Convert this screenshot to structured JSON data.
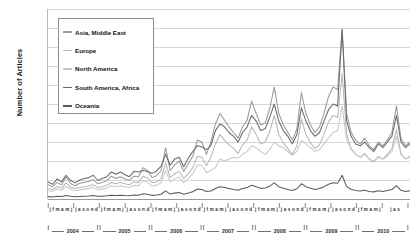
{
  "chart_data": {
    "type": "line",
    "title": "",
    "xlabel": "",
    "ylabel": "Number of Articles",
    "ylim": [
      0,
      2000
    ],
    "yticks": [
      0,
      200,
      400,
      600,
      800,
      1000,
      1200,
      1400,
      1600,
      1800,
      2000
    ],
    "grid": true,
    "legend_position": "upper-left-inside",
    "years": [
      "2004",
      "2005",
      "2006",
      "2007",
      "2008",
      "2009",
      "2010"
    ],
    "months_pattern": [
      "j",
      "f",
      "m",
      "a",
      "m",
      "j",
      "j",
      "a",
      "s",
      "o",
      "n",
      "d"
    ],
    "month_axis_groups": [
      "j f m a m j",
      "j a s o n d",
      "j f m a m j",
      "j a s o n d",
      "j f m a m j",
      "j a s o n d",
      "j f m a m j",
      "j a s o n d",
      "j f m a m j",
      "j a s o n d",
      "j f m a m j",
      "j a s o n d",
      "j f m a m j",
      "j a s"
    ],
    "x": [
      "2004-01",
      "2004-02",
      "2004-03",
      "2004-04",
      "2004-05",
      "2004-06",
      "2004-07",
      "2004-08",
      "2004-09",
      "2004-10",
      "2004-11",
      "2004-12",
      "2005-01",
      "2005-02",
      "2005-03",
      "2005-04",
      "2005-05",
      "2005-06",
      "2005-07",
      "2005-08",
      "2005-09",
      "2005-10",
      "2005-11",
      "2005-12",
      "2006-01",
      "2006-02",
      "2006-03",
      "2006-04",
      "2006-05",
      "2006-06",
      "2006-07",
      "2006-08",
      "2006-09",
      "2006-10",
      "2006-11",
      "2006-12",
      "2007-01",
      "2007-02",
      "2007-03",
      "2007-04",
      "2007-05",
      "2007-06",
      "2007-07",
      "2007-08",
      "2007-09",
      "2007-10",
      "2007-11",
      "2007-12",
      "2008-01",
      "2008-02",
      "2008-03",
      "2008-04",
      "2008-05",
      "2008-06",
      "2008-07",
      "2008-08",
      "2008-09",
      "2008-10",
      "2008-11",
      "2008-12",
      "2009-01",
      "2009-02",
      "2009-03",
      "2009-04",
      "2009-05",
      "2009-06",
      "2009-07",
      "2009-08",
      "2009-09",
      "2009-10",
      "2009-11",
      "2009-12",
      "2010-01",
      "2010-02",
      "2010-03",
      "2010-04",
      "2010-05",
      "2010-06",
      "2010-07",
      "2010-08",
      "2010-09"
    ],
    "series": [
      {
        "name": "Asia, Middle East",
        "color": "#9a9a9a",
        "values": [
          150,
          130,
          175,
          150,
          235,
          160,
          140,
          165,
          175,
          185,
          205,
          160,
          175,
          195,
          240,
          215,
          235,
          210,
          195,
          240,
          235,
          330,
          300,
          225,
          245,
          300,
          540,
          300,
          360,
          400,
          290,
          370,
          450,
          620,
          600,
          470,
          600,
          790,
          900,
          830,
          760,
          700,
          640,
          760,
          830,
          1030,
          900,
          780,
          800,
          950,
          1180,
          900,
          780,
          700,
          620,
          740,
          1120,
          900,
          780,
          700,
          760,
          900,
          1080,
          1180,
          1150,
          1790,
          900,
          700,
          620,
          580,
          640,
          560,
          520,
          600,
          560,
          620,
          700,
          980,
          640,
          560,
          600
        ]
      },
      {
        "name": "Europe",
        "color": "#b8b8b8",
        "values": [
          110,
          100,
          130,
          115,
          170,
          125,
          110,
          120,
          130,
          140,
          150,
          120,
          130,
          145,
          175,
          160,
          175,
          160,
          150,
          180,
          175,
          240,
          220,
          170,
          180,
          215,
          380,
          225,
          265,
          290,
          215,
          270,
          330,
          450,
          440,
          350,
          440,
          580,
          680,
          620,
          570,
          530,
          480,
          570,
          620,
          760,
          680,
          580,
          600,
          710,
          880,
          680,
          590,
          530,
          470,
          560,
          840,
          680,
          590,
          530,
          570,
          680,
          810,
          880,
          860,
          1320,
          680,
          530,
          470,
          440,
          480,
          420,
          390,
          450,
          420,
          470,
          530,
          730,
          480,
          420,
          450
        ]
      },
      {
        "name": "North America",
        "color": "#c9c9c9",
        "values": [
          90,
          80,
          105,
          92,
          135,
          100,
          88,
          96,
          104,
          112,
          120,
          96,
          104,
          116,
          140,
          128,
          140,
          128,
          120,
          144,
          140,
          192,
          176,
          136,
          144,
          172,
          300,
          180,
          212,
          232,
          172,
          216,
          264,
          360,
          352,
          280,
          300,
          330,
          420,
          400,
          420,
          440,
          430,
          470,
          500,
          560,
          540,
          500,
          470,
          520,
          600,
          560,
          540,
          500,
          460,
          500,
          620,
          580,
          540,
          500,
          520,
          580,
          640,
          700,
          720,
          980,
          620,
          520,
          470,
          440,
          470,
          420,
          400,
          440,
          420,
          450,
          500,
          660,
          470,
          420,
          440
        ]
      },
      {
        "name": "South America, Africa",
        "color": "#6b6b6b",
        "values": [
          180,
          155,
          210,
          180,
          250,
          195,
          170,
          200,
          215,
          225,
          250,
          195,
          215,
          235,
          285,
          260,
          285,
          255,
          235,
          290,
          285,
          300,
          290,
          270,
          295,
          345,
          470,
          355,
          420,
          440,
          340,
          430,
          500,
          560,
          550,
          520,
          560,
          720,
          790,
          760,
          700,
          660,
          600,
          700,
          760,
          880,
          820,
          720,
          740,
          860,
          1000,
          820,
          720,
          660,
          580,
          680,
          960,
          820,
          720,
          660,
          700,
          820,
          940,
          1000,
          980,
          1780,
          820,
          660,
          580,
          560,
          600,
          540,
          500,
          580,
          540,
          600,
          660,
          880,
          600,
          540,
          580
        ]
      },
      {
        "name": "Oceania",
        "color": "#5a5a5a",
        "values": [
          25,
          22,
          30,
          26,
          38,
          28,
          24,
          27,
          30,
          32,
          36,
          28,
          30,
          34,
          40,
          36,
          40,
          36,
          34,
          42,
          40,
          55,
          50,
          38,
          42,
          50,
          85,
          52,
          62,
          68,
          50,
          62,
          76,
          105,
          100,
          80,
          85,
          110,
          130,
          120,
          110,
          100,
          92,
          110,
          120,
          145,
          130,
          112,
          115,
          135,
          170,
          130,
          112,
          100,
          90,
          108,
          160,
          130,
          112,
          100,
          110,
          130,
          155,
          170,
          165,
          250,
          130,
          100,
          90,
          84,
          92,
          80,
          75,
          86,
          80,
          90,
          100,
          140,
          92,
          80,
          86
        ]
      }
    ]
  }
}
